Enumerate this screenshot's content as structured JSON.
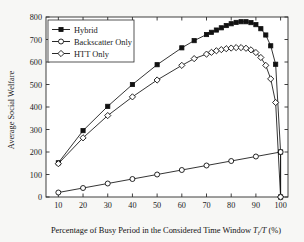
{
  "chart_data": {
    "type": "line",
    "title": "",
    "xlabel": "Percentage of Busy Period in the Considered Time Window T",
    "xlabel_sub": "i",
    "xlabel_tail": "/T (%)",
    "ylabel": "Average Social Welfare",
    "xlim": [
      5,
      103
    ],
    "ylim": [
      0,
      800
    ],
    "xticks": [
      10,
      20,
      30,
      40,
      50,
      60,
      70,
      80,
      90,
      100
    ],
    "yticks": [
      0,
      100,
      200,
      300,
      400,
      500,
      600,
      700,
      800
    ],
    "grid": false,
    "legend_position": "top-left",
    "series": [
      {
        "name": "Hybrid",
        "marker": "filled-square",
        "x": [
          10,
          20,
          30,
          40,
          50,
          60,
          65,
          70,
          72,
          74,
          76,
          78,
          80,
          82,
          84,
          86,
          88,
          90,
          92,
          94,
          96,
          98,
          100,
          100
        ],
        "values": [
          152,
          295,
          403,
          500,
          588,
          663,
          695,
          722,
          732,
          742,
          752,
          762,
          770,
          776,
          779,
          779,
          775,
          766,
          748,
          720,
          672,
          590,
          200,
          0
        ]
      },
      {
        "name": "Backscatter Only",
        "marker": "open-circle",
        "x": [
          10,
          20,
          30,
          40,
          50,
          60,
          70,
          80,
          90,
          100,
          100
        ],
        "values": [
          20,
          40,
          60,
          80,
          100,
          120,
          140,
          160,
          180,
          200,
          0
        ]
      },
      {
        "name": "HTT Only",
        "marker": "open-diamond",
        "x": [
          10,
          20,
          30,
          40,
          50,
          60,
          65,
          70,
          72,
          74,
          76,
          78,
          80,
          82,
          84,
          86,
          88,
          90,
          92,
          94,
          96,
          98,
          100
        ],
        "values": [
          148,
          263,
          362,
          445,
          520,
          585,
          615,
          635,
          643,
          650,
          655,
          659,
          662,
          664,
          664,
          661,
          654,
          642,
          620,
          585,
          525,
          420,
          0
        ]
      }
    ]
  },
  "legend": {
    "items": [
      {
        "label": "Hybrid"
      },
      {
        "label": "Backscatter Only"
      },
      {
        "label": "HTT Only"
      }
    ]
  }
}
